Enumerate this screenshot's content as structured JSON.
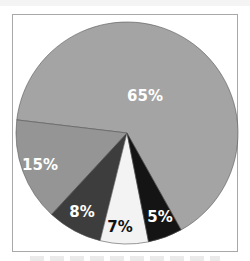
{
  "chart_data": {
    "type": "pie",
    "title": "",
    "categories": [
      "65%",
      "15%",
      "8%",
      "7%",
      "5%"
    ],
    "values": [
      65,
      15,
      8,
      7,
      5
    ],
    "labels": [
      "65%",
      "15%",
      "8%",
      "7%",
      "5%"
    ],
    "colors": [
      "#a4a4a4",
      "#959595",
      "#3d3d3d",
      "#f3f3f3",
      "#141414"
    ],
    "label_colors": [
      "#ffffff",
      "#ffffff",
      "#ffffff",
      "#111111",
      "#ffffff"
    ],
    "start_angle_deg": 60.8,
    "direction": "counterclockwise-from-5%",
    "legend": "none",
    "geometry": {
      "cx": 127,
      "cy": 133,
      "r": 111
    },
    "label_positions": [
      [
        145,
        96
      ],
      [
        40,
        165
      ],
      [
        82,
        212
      ],
      [
        120,
        227
      ],
      [
        160,
        217
      ]
    ]
  }
}
